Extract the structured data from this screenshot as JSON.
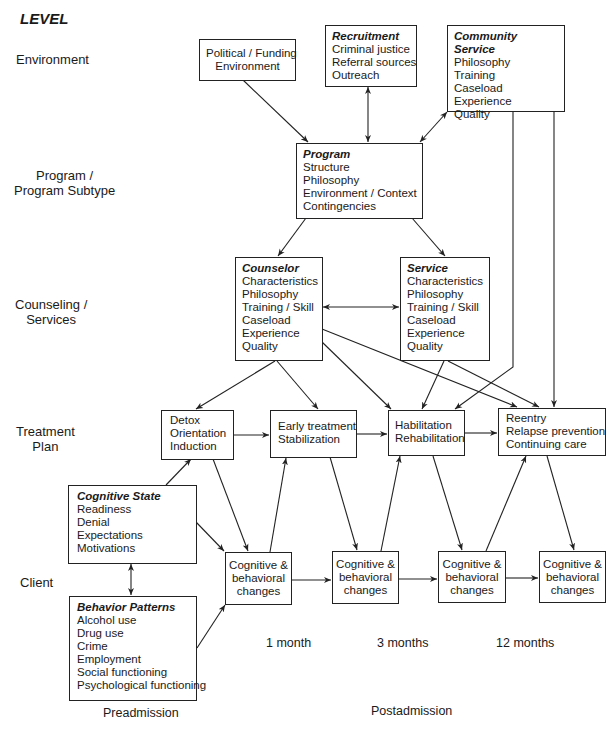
{
  "level_title": "LEVEL",
  "levels": [
    {
      "label": "Environment"
    },
    {
      "label": "Program /\nProgram Subtype"
    },
    {
      "label": "Counseling /\nServices"
    },
    {
      "label": "Treatment\nPlan"
    },
    {
      "label": "Client"
    }
  ],
  "boxes": {
    "political": {
      "lines": [
        "Political / Funding",
        "Environment"
      ]
    },
    "recruitment": {
      "title": "Recruitment",
      "lines": [
        "Criminal justice",
        "Referral sources",
        "Outreach"
      ]
    },
    "community_service": {
      "title": "Community Service",
      "lines": [
        "Philosophy",
        "Training",
        "Caseload",
        "Experience",
        "Quality"
      ]
    },
    "program": {
      "title": "Program",
      "lines": [
        "Structure",
        "Philosophy",
        "Environment / Context",
        "Contingencies"
      ]
    },
    "counselor": {
      "title": "Counselor",
      "lines": [
        "Characteristics",
        "Philosophy",
        "Training / Skill",
        "Caseload",
        "Experience",
        "Quality"
      ]
    },
    "service": {
      "title": "Service",
      "lines": [
        "Characteristics",
        "Philosophy",
        "Training / Skill",
        "Caseload",
        "Experience",
        "Quality"
      ]
    },
    "detox": {
      "lines": [
        "Detox",
        "Orientation",
        "Induction"
      ]
    },
    "early_treatment": {
      "lines": [
        "Early treatment",
        "Stabilization"
      ]
    },
    "habilitation": {
      "lines": [
        "Habilitation",
        "Rehabilitation"
      ]
    },
    "reentry": {
      "lines": [
        "Reentry",
        "Relapse prevention",
        "Continuing care"
      ]
    },
    "cognitive_state": {
      "title": "Cognitive State",
      "lines": [
        "Readiness",
        "Denial",
        "Expectations",
        "Motivations"
      ]
    },
    "behavior_patterns": {
      "title": "Behavior Patterns",
      "lines": [
        "Alcohol use",
        "Drug use",
        "Crime",
        "Employment",
        "Social functioning",
        "Psychological functioning"
      ]
    },
    "cb1": {
      "lines": [
        "Cognitive &",
        "behavioral",
        "changes"
      ]
    },
    "cb2": {
      "lines": [
        "Cognitive &",
        "behavioral",
        "changes"
      ]
    },
    "cb3": {
      "lines": [
        "Cognitive &",
        "behavioral",
        "changes"
      ]
    },
    "cb4": {
      "lines": [
        "Cognitive &",
        "behavioral",
        "changes"
      ]
    }
  },
  "time_labels": {
    "t1": "1 month",
    "t2": "3 months",
    "t3": "12 months",
    "preadmission": "Preadmission",
    "postadmission": "Postadmission"
  }
}
